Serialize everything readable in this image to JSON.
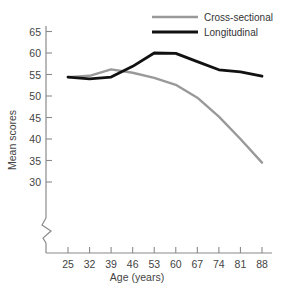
{
  "chart_data": {
    "type": "line",
    "title": "",
    "xlabel": "Age (years)",
    "ylabel": "Mean scores",
    "categories": [
      25,
      32,
      39,
      46,
      53,
      60,
      67,
      74,
      81,
      88
    ],
    "x": [
      25,
      32,
      39,
      46,
      53,
      60,
      67,
      74,
      81,
      88
    ],
    "xtick_labels": [
      "25",
      "32",
      "39",
      "46",
      "53",
      "60",
      "67",
      "74",
      "81",
      "88"
    ],
    "ytick_labels": [
      "65",
      "60",
      "55",
      "50",
      "45",
      "40",
      "35",
      "30"
    ],
    "yticks": [
      65,
      60,
      55,
      50,
      45,
      40,
      35,
      30
    ],
    "ylim": [
      28.5,
      66.5
    ],
    "y_axis_break": true,
    "grid": false,
    "legend_position": "top-right",
    "series": [
      {
        "name": "Cross-sectional",
        "color": "#999999",
        "values": [
          54.4,
          54.7,
          56.2,
          55.4,
          54.2,
          52.6,
          49.6,
          45.2,
          40.0,
          34.5
        ]
      },
      {
        "name": "Longitudinal",
        "color": "#111111",
        "values": [
          54.4,
          54.0,
          54.4,
          56.9,
          60.0,
          59.9,
          58.0,
          56.1,
          55.6,
          54.6
        ]
      }
    ]
  },
  "axis": {
    "y_title": "Mean scores",
    "x_title": "Age (years)"
  },
  "legend": {
    "items": [
      {
        "label": "Cross-sectional",
        "color": "#999999"
      },
      {
        "label": "Longitudinal",
        "color": "#111111"
      }
    ]
  }
}
